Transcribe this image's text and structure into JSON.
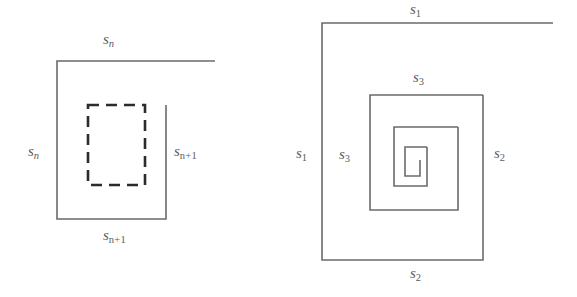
{
  "figure": {
    "background_color": "#ffffff",
    "stroke_color": "#6b6b6b",
    "dashed_stroke_color": "#2b2b2b",
    "label_color": "#5b5b5b"
  },
  "left_figure": {
    "name": "nested-squares-sn-sn1",
    "outer_square": {
      "x": 57,
      "y": 61,
      "width": 109,
      "height": 158,
      "note": "open corner at top-right; top edge extends past corner to x=215"
    },
    "top_edge_extension_x": 215,
    "dashed_square": {
      "x": 88,
      "y": 105,
      "width": 57,
      "height": 80
    },
    "labels": [
      {
        "id": "sn-top",
        "base": "s",
        "sub": "n",
        "text": "sn"
      },
      {
        "id": "sn-left",
        "base": "s",
        "sub": "n",
        "text": "sn"
      },
      {
        "id": "sn1-right",
        "base": "s",
        "sub": "n+1",
        "text": "sn+1"
      },
      {
        "id": "sn1-bottom",
        "base": "s",
        "sub": "n+1",
        "text": "sn+1"
      }
    ]
  },
  "right_figure": {
    "name": "nested-spiral-squares-s1-s2-s3",
    "squares": [
      {
        "id": "s1-s2-outer",
        "x": 322,
        "y": 23,
        "width": 161,
        "height": 237,
        "top_edge_extension_x": 553
      },
      {
        "id": "s3-middle",
        "x": 370,
        "y": 95,
        "width": 113,
        "height": 115
      },
      {
        "id": "ring-3",
        "x": 394,
        "y": 127,
        "width": 64,
        "height": 59
      },
      {
        "id": "ring-4-core",
        "x": 405,
        "y": 147,
        "width": 22,
        "height": 29
      }
    ],
    "labels": [
      {
        "id": "s1-top",
        "base": "s",
        "sub": "1",
        "text": "s1"
      },
      {
        "id": "s1-left",
        "base": "s",
        "sub": "1",
        "text": "s1"
      },
      {
        "id": "s2-right",
        "base": "s",
        "sub": "2",
        "text": "s2"
      },
      {
        "id": "s2-bottom",
        "base": "s",
        "sub": "2",
        "text": "s2"
      },
      {
        "id": "s3-top",
        "base": "s",
        "sub": "3",
        "text": "s3"
      },
      {
        "id": "s3-left",
        "base": "s",
        "sub": "3",
        "text": "s3"
      }
    ]
  }
}
